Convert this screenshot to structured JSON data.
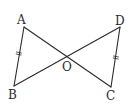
{
  "diagram": {
    "type": "geometry",
    "points": {
      "A": {
        "label": "A",
        "x": 24,
        "y": 27
      },
      "B": {
        "label": "B",
        "x": 14,
        "y": 86
      },
      "C": {
        "label": "C",
        "x": 111,
        "y": 87
      },
      "D": {
        "label": "D",
        "x": 120,
        "y": 27
      },
      "O": {
        "label": "O",
        "x": 66,
        "y": 57
      }
    },
    "segments": [
      {
        "from": "A",
        "to": "B",
        "equal_mark": true
      },
      {
        "from": "A",
        "to": "C",
        "equal_mark": false
      },
      {
        "from": "B",
        "to": "D",
        "equal_mark": false
      },
      {
        "from": "D",
        "to": "C",
        "equal_mark": true
      }
    ],
    "labels": {
      "A": "A",
      "B": "B",
      "C": "C",
      "D": "D",
      "O": "O"
    },
    "colors": {
      "stroke": "#2a2a2a",
      "background": "#ffffff"
    }
  }
}
